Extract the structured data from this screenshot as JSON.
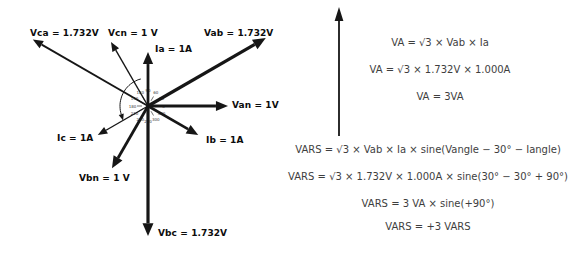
{
  "colors": {
    "ink": "#161616",
    "dial": "#3a3a3a",
    "formula_text": "#3e3e3e",
    "label_text": "#0c0c0c"
  },
  "diagram": {
    "center": {
      "x": 148,
      "y": 106
    },
    "vectors": [
      {
        "id": "vab",
        "label": "Vab = 1.732V",
        "angle": 30,
        "length": 136,
        "stroke": 3.2
      },
      {
        "id": "vca",
        "label": "Vca = 1.732V",
        "angle": 150,
        "length": 133,
        "stroke": 1.8
      },
      {
        "id": "vbc",
        "label": "Vbc = 1.732V",
        "angle": 270,
        "length": 130,
        "stroke": 3.2
      },
      {
        "id": "van",
        "label": "Van = 1V",
        "angle": 0,
        "length": 80,
        "stroke": 2.8
      },
      {
        "id": "vcn",
        "label": "Vcn = 1 V",
        "angle": 120,
        "length": 74,
        "stroke": 1.4
      },
      {
        "id": "vbn",
        "label": "Vbn = 1 V",
        "angle": 240,
        "length": 72,
        "stroke": 2.8
      },
      {
        "id": "ia",
        "label": "Ia = 1A",
        "angle": 90,
        "length": 54,
        "stroke": 2.8
      },
      {
        "id": "ib",
        "label": "Ib = 1A",
        "angle": -30,
        "length": 58,
        "stroke": 2.6
      },
      {
        "id": "ic",
        "label": "Ic = 1A",
        "angle": 210,
        "length": 58,
        "stroke": 1.4
      }
    ],
    "dial_labels": [
      "0",
      "30",
      "60",
      "90",
      "120",
      "150",
      "180",
      "210",
      "240",
      "270",
      "300",
      "330"
    ],
    "rotation_arc": {
      "start_deg": 105,
      "end_deg": 197,
      "radius": 28
    }
  },
  "formulas": {
    "va": [
      "VA = √3 × Vab × Ia",
      "VA = √3 × 1.732V × 1.000A",
      "VA = 3VA"
    ],
    "vars": [
      "VARS = √3 × Vab × Ia × sine(Vangle − 30° − Iangle)",
      "VARS = √3 × 1.732V × 1.000A × sine(30° − 30° + 90°)",
      "VARS = 3 VA × sine(+90°)",
      "VARS = +3 VARS"
    ]
  }
}
